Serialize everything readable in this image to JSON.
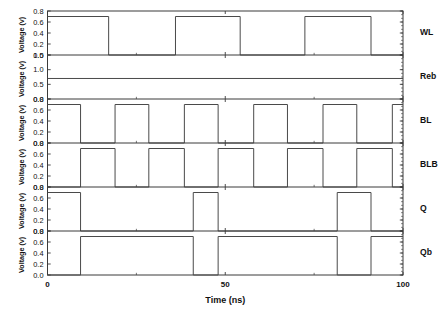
{
  "chart_data": {
    "type": "line",
    "title": "",
    "xlabel": "Time (ns)",
    "ylabel": "Voltage (v)",
    "xlim": [
      0,
      100
    ],
    "xticks": [
      0,
      50,
      100
    ],
    "xticklabels": [
      "0",
      "50",
      "100"
    ],
    "grid": false,
    "legend": "right-of-panel-signal-names",
    "panel_count": 6,
    "panels": [
      {
        "name": "WL",
        "ylabel": "Voltage (v)",
        "ylim": [
          0.0,
          0.8
        ],
        "yticks": [
          0.0,
          0.2,
          0.4,
          0.6,
          0.8
        ],
        "yticklabels": [
          "0.0",
          "0.2",
          "0.4",
          "0.6",
          "0.8"
        ],
        "v_low": 0.0,
        "v_high": 0.7,
        "series": [
          {
            "name": "WL",
            "x": [
              0,
              17.2,
              17.2,
              36.0,
              36.0,
              54.2,
              54.2,
              72.4,
              72.4,
              91.0,
              91.0,
              100
            ],
            "y": [
              0.7,
              0.7,
              0.0,
              0.0,
              0.7,
              0.7,
              0.0,
              0.0,
              0.7,
              0.7,
              0.0,
              0.0
            ]
          }
        ]
      },
      {
        "name": "Reb",
        "ylabel": "Voltage (v)",
        "ylim": [
          0.0,
          1.5
        ],
        "yticks": [
          0.0,
          0.5,
          1.0,
          1.5
        ],
        "yticklabels": [
          "0.0",
          "0.5",
          "1.0",
          "1.5"
        ],
        "v_low": 0.7,
        "v_high": 0.7,
        "series": [
          {
            "name": "Reb",
            "x": [
              0,
              100
            ],
            "y": [
              0.7,
              0.7
            ]
          }
        ]
      },
      {
        "name": "BL",
        "ylabel": "Voltage (v)",
        "ylim": [
          0.0,
          0.8
        ],
        "yticks": [
          0.0,
          0.2,
          0.4,
          0.6,
          0.8
        ],
        "yticklabels": [
          "0.0",
          "0.2",
          "0.4",
          "0.6",
          "0.8"
        ],
        "v_low": 0.0,
        "v_high": 0.7,
        "series": [
          {
            "name": "BL",
            "x": [
              0,
              9.3,
              9.3,
              19.0,
              19.0,
              28.5,
              28.5,
              38.5,
              38.5,
              48.0,
              48.0,
              58.0,
              58.0,
              67.5,
              67.5,
              77.5,
              77.5,
              87.0,
              87.0,
              97.0,
              97.0,
              100
            ],
            "y": [
              0.7,
              0.7,
              0.0,
              0.0,
              0.7,
              0.7,
              0.0,
              0.0,
              0.7,
              0.7,
              0.0,
              0.0,
              0.7,
              0.7,
              0.0,
              0.0,
              0.7,
              0.7,
              0.0,
              0.0,
              0.7,
              0.7
            ]
          }
        ]
      },
      {
        "name": "BLB",
        "ylabel": "Voltage (v)",
        "ylim": [
          0.0,
          0.8
        ],
        "yticks": [
          0.0,
          0.2,
          0.4,
          0.6,
          0.8
        ],
        "yticklabels": [
          "0.0",
          "0.2",
          "0.4",
          "0.6",
          "0.8"
        ],
        "v_low": 0.0,
        "v_high": 0.7,
        "series": [
          {
            "name": "BLB",
            "x": [
              0,
              9.3,
              9.3,
              19.0,
              19.0,
              28.5,
              28.5,
              38.5,
              38.5,
              48.0,
              48.0,
              58.0,
              58.0,
              67.5,
              67.5,
              77.5,
              77.5,
              87.0,
              87.0,
              97.0,
              97.0,
              100
            ],
            "y": [
              0.0,
              0.0,
              0.7,
              0.7,
              0.0,
              0.0,
              0.7,
              0.7,
              0.0,
              0.0,
              0.7,
              0.7,
              0.0,
              0.0,
              0.7,
              0.7,
              0.0,
              0.0,
              0.7,
              0.7,
              0.0,
              0.0
            ]
          }
        ]
      },
      {
        "name": "Q",
        "ylabel": "Voltage (v)",
        "ylim": [
          0.0,
          0.8
        ],
        "yticks": [
          0.0,
          0.2,
          0.4,
          0.6,
          0.8
        ],
        "yticklabels": [
          "0.0",
          "0.2",
          "0.4",
          "0.6",
          "0.8"
        ],
        "v_low": 0.0,
        "v_high": 0.7,
        "series": [
          {
            "name": "Q",
            "x": [
              0,
              9.3,
              9.3,
              41.0,
              41.0,
              48.0,
              48.0,
              81.5,
              81.5,
              91.0,
              91.0,
              100
            ],
            "y": [
              0.7,
              0.7,
              0.0,
              0.0,
              0.7,
              0.7,
              0.0,
              0.0,
              0.7,
              0.7,
              0.0,
              0.0
            ]
          }
        ]
      },
      {
        "name": "Qb",
        "ylabel": "Voltage (v)",
        "ylim": [
          0.0,
          0.8
        ],
        "yticks": [
          0.0,
          0.2,
          0.4,
          0.6,
          0.8
        ],
        "yticklabels": [
          "0.0",
          "0.2",
          "0.4",
          "0.6",
          "0.8"
        ],
        "v_low": 0.0,
        "v_high": 0.7,
        "series": [
          {
            "name": "Qb",
            "x": [
              0,
              9.3,
              9.3,
              41.0,
              41.0,
              48.0,
              48.0,
              81.5,
              81.5,
              91.0,
              91.0,
              100
            ],
            "y": [
              0.0,
              0.0,
              0.7,
              0.7,
              0.0,
              0.0,
              0.7,
              0.7,
              0.0,
              0.0,
              0.7,
              0.7
            ]
          }
        ]
      }
    ]
  },
  "axis": {
    "x_title": "Time (ns)",
    "y_title": "Voltage (v)",
    "x_tick_labels": [
      "0",
      "50",
      "100"
    ]
  },
  "signal_labels": [
    "WL",
    "Reb",
    "BL",
    "BLB",
    "Q",
    "Qb"
  ],
  "colors": {
    "trace": "#4a4a4a",
    "frame": "#3a3a3a",
    "text": "#111111",
    "background": "#ffffff"
  }
}
